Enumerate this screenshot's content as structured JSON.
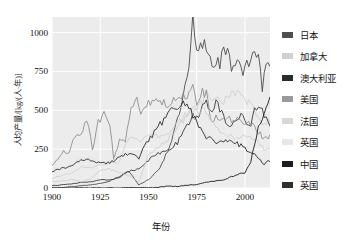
{
  "chart_data": {
    "type": "line",
    "title": "",
    "xlabel": "年份",
    "ylabel": "人均产量/[kg/(人·年)]",
    "xlim": [
      1900,
      2013
    ],
    "ylim": [
      0,
      1100
    ],
    "xticks": [
      1900,
      1925,
      1950,
      1975,
      2000
    ],
    "yticks": [
      0,
      250,
      500,
      750,
      1000
    ],
    "grid": true,
    "grid_color": "#ffffff",
    "plot_background": "#ececed",
    "legend_position": "right",
    "series": [
      {
        "name": "日本",
        "color": "#4d4d4d",
        "x": [
          1900,
          1905,
          1910,
          1915,
          1920,
          1925,
          1930,
          1935,
          1940,
          1945,
          1950,
          1955,
          1960,
          1963,
          1965,
          1967,
          1969,
          1971,
          1973,
          1975,
          1977,
          1979,
          1981,
          1983,
          1985,
          1987,
          1989,
          1991,
          1993,
          1995,
          1997,
          1999,
          2001,
          2003,
          2005,
          2007,
          2009,
          2011,
          2013
        ],
        "values": [
          2,
          4,
          8,
          15,
          20,
          30,
          45,
          75,
          110,
          20,
          55,
          110,
          240,
          350,
          430,
          530,
          640,
          760,
          1070,
          860,
          900,
          940,
          880,
          790,
          830,
          800,
          880,
          860,
          780,
          820,
          830,
          750,
          800,
          790,
          870,
          900,
          640,
          790,
          760
        ]
      },
      {
        "name": "加拿大",
        "color": "#d0d0d0",
        "x": [
          1900,
          1905,
          1910,
          1915,
          1920,
          1925,
          1930,
          1935,
          1940,
          1945,
          1950,
          1955,
          1960,
          1965,
          1970,
          1975,
          1980,
          1985,
          1990,
          1995,
          2000,
          2005,
          2010,
          2013
        ],
        "values": [
          60,
          80,
          95,
          140,
          130,
          150,
          160,
          170,
          330,
          310,
          330,
          340,
          330,
          420,
          480,
          490,
          610,
          560,
          560,
          610,
          560,
          510,
          400,
          440
        ]
      },
      {
        "name": "澳大利亚",
        "color": "#3a3a3a",
        "x": [
          1900,
          1905,
          1910,
          1915,
          1920,
          1925,
          1930,
          1935,
          1940,
          1945,
          1950,
          1955,
          1960,
          1965,
          1970,
          1973,
          1975,
          1978,
          1980,
          1983,
          1985,
          1988,
          1990,
          1993,
          1995,
          1998,
          2000,
          2003,
          2005,
          2008,
          2010,
          2013
        ],
        "values": [
          15,
          20,
          25,
          35,
          40,
          55,
          50,
          70,
          110,
          120,
          180,
          220,
          240,
          290,
          400,
          480,
          440,
          530,
          560,
          480,
          540,
          490,
          420,
          390,
          450,
          460,
          430,
          420,
          490,
          510,
          470,
          390
        ]
      },
      {
        "name": "美国",
        "color": "#8f8f8f",
        "x": [
          1900,
          1903,
          1906,
          1909,
          1912,
          1915,
          1918,
          1921,
          1924,
          1927,
          1930,
          1932,
          1935,
          1938,
          1941,
          1944,
          1946,
          1950,
          1955,
          1960,
          1965,
          1970,
          1973,
          1975,
          1978,
          1980,
          1983,
          1985,
          1990,
          1995,
          2000,
          2005,
          2008,
          2010,
          2013
        ],
        "values": [
          140,
          190,
          230,
          230,
          330,
          350,
          440,
          250,
          430,
          470,
          420,
          180,
          310,
          310,
          540,
          560,
          480,
          560,
          560,
          530,
          600,
          570,
          660,
          520,
          620,
          600,
          410,
          470,
          440,
          440,
          430,
          390,
          350,
          310,
          330
        ]
      },
      {
        "name": "法国",
        "color": "#cfcfcf",
        "x": [
          1900,
          1905,
          1910,
          1915,
          1920,
          1925,
          1930,
          1935,
          1940,
          1945,
          1950,
          1955,
          1960,
          1965,
          1970,
          1974,
          1976,
          1979,
          1982,
          1985,
          1990,
          1995,
          2000,
          2005,
          2010,
          2013
        ],
        "values": [
          40,
          45,
          55,
          40,
          60,
          110,
          120,
          100,
          80,
          40,
          210,
          260,
          310,
          390,
          470,
          530,
          470,
          540,
          420,
          400,
          340,
          320,
          340,
          320,
          250,
          250
        ]
      },
      {
        "name": "英国",
        "color": "#e3e3e3",
        "x": [
          1900,
          1905,
          1910,
          1915,
          1920,
          1925,
          1930,
          1935,
          1940,
          1945,
          1950,
          1955,
          1960,
          1965,
          1970,
          1975,
          1980,
          1985,
          1990,
          1995,
          2000,
          2005,
          2010,
          2013
        ],
        "values": [
          120,
          130,
          140,
          190,
          190,
          170,
          170,
          210,
          230,
          200,
          320,
          400,
          480,
          540,
          550,
          430,
          340,
          300,
          310,
          300,
          260,
          220,
          160,
          180
        ]
      },
      {
        "name": "中国",
        "color": "#1c1c1c",
        "x": [
          1900,
          1910,
          1920,
          1930,
          1940,
          1949,
          1955,
          1960,
          1965,
          1970,
          1975,
          1980,
          1985,
          1990,
          1995,
          2000,
          2003,
          2005,
          2007,
          2009,
          2011,
          2013
        ],
        "values": [
          0,
          0,
          1,
          1,
          2,
          1,
          4,
          12,
          10,
          18,
          23,
          37,
          45,
          57,
          82,
          100,
          170,
          270,
          380,
          430,
          510,
          570
        ]
      },
      {
        "name": "英国",
        "color": "#2e2e2e",
        "x": [
          1900,
          1905,
          1910,
          1915,
          1920,
          1925,
          1930,
          1935,
          1940,
          1945,
          1950,
          1955,
          1960,
          1965,
          1970,
          1975,
          1980,
          1985,
          1990,
          1995,
          2000,
          2005,
          2010,
          2013
        ],
        "values": [
          110,
          125,
          135,
          180,
          180,
          165,
          160,
          200,
          225,
          195,
          310,
          390,
          470,
          530,
          540,
          420,
          330,
          295,
          300,
          295,
          255,
          215,
          155,
          175
        ]
      }
    ]
  },
  "legend": {
    "items": [
      {
        "label": "日本",
        "color": "#4d4d4d"
      },
      {
        "label": "加拿大",
        "color": "#d0d0d0"
      },
      {
        "label": "澳大利亚",
        "color": "#2b2b2b"
      },
      {
        "label": "美国",
        "color": "#9a9a9a"
      },
      {
        "label": "法国",
        "color": "#d8d8d8"
      },
      {
        "label": "英国",
        "color": "#e6e6e6"
      },
      {
        "label": "中国",
        "color": "#1c1c1c"
      },
      {
        "label": "英国",
        "color": "#2e2e2e"
      }
    ]
  }
}
